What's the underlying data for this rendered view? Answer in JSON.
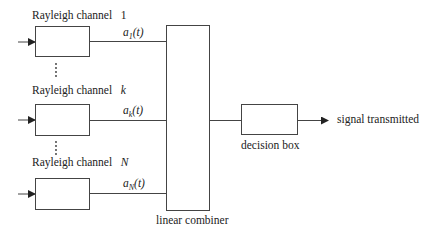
{
  "diagram": {
    "type": "block-diagram",
    "channels": [
      {
        "label": "Rayleigh   channel",
        "index": "1",
        "weight_symbol": "a",
        "weight_sub": "1",
        "weight_arg": "(t)"
      },
      {
        "label": "Rayleigh   channel",
        "index": "k",
        "weight_symbol": "a",
        "weight_sub": "k",
        "weight_arg": "(t)"
      },
      {
        "label": "Rayleigh   channel",
        "index": "N",
        "weight_symbol": "a",
        "weight_sub": "N",
        "weight_arg": "(t)"
      }
    ],
    "ellipsis": "⋮",
    "combiner_label": "linear combiner",
    "decision_label": "decision box",
    "output_label": "signal transmitted",
    "colors": {
      "stroke": "#444444",
      "text": "#222222",
      "background": "#ffffff"
    }
  }
}
